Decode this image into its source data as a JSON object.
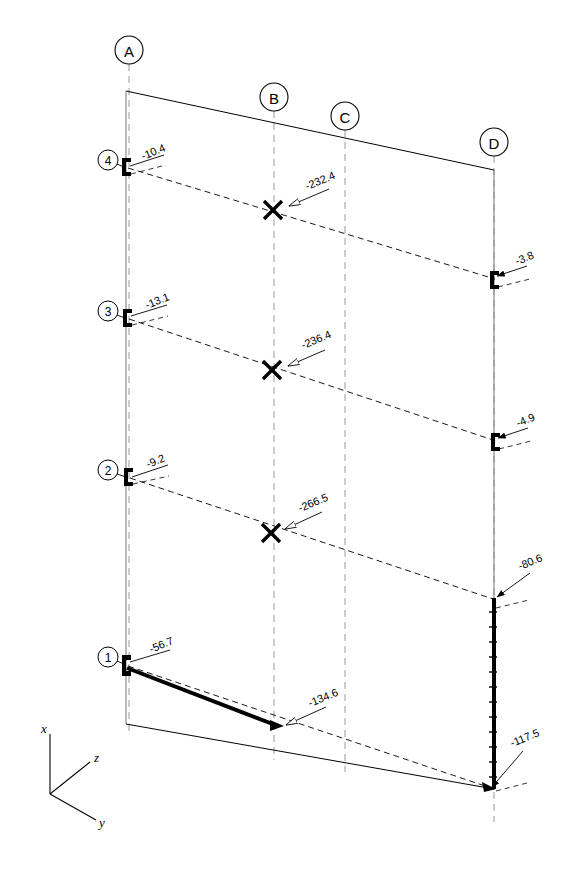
{
  "diagram": {
    "type": "structural-frame-elevation",
    "title": "",
    "background_color": "#ffffff",
    "line_color": "#000000",
    "grid_color": "#9a9a9a",
    "grid_lines": [
      {
        "id": "A",
        "label": "A",
        "bubble_cx": 129,
        "bubble_cy": 50,
        "x_top": 129,
        "x_bottom": 129,
        "line_top": 64,
        "line_bottom": 736
      },
      {
        "id": "B",
        "label": "B",
        "bubble_cx": 274,
        "bubble_cy": 97,
        "x_top": 274,
        "x_bottom": 274,
        "line_top": 111,
        "line_bottom": 760
      },
      {
        "id": "C",
        "label": "C",
        "bubble_cx": 345,
        "bubble_cy": 116,
        "x_top": 345,
        "x_bottom": 345,
        "line_top": 130,
        "line_bottom": 772
      },
      {
        "id": "D",
        "label": "D",
        "bubble_cx": 494,
        "bubble_cy": 142,
        "x_top": 494,
        "x_bottom": 494,
        "line_top": 156,
        "line_bottom": 822
      }
    ],
    "levels": [
      {
        "id": "4",
        "label": "4",
        "bubble_cx": 108,
        "bubble_cy": 160,
        "y_left": 164
      },
      {
        "id": "3",
        "label": "3",
        "bubble_cx": 108,
        "bubble_cy": 311,
        "y_left": 315
      },
      {
        "id": "2",
        "label": "2",
        "bubble_cx": 108,
        "bubble_cy": 470,
        "y_left": 474
      },
      {
        "id": "1",
        "label": "1",
        "bubble_cx": 108,
        "bubble_cy": 657,
        "y_left": 661
      }
    ],
    "value_labels": [
      {
        "id": "lvl4-left",
        "value": "-10.4",
        "text_x": 143,
        "text_y": 160,
        "rotate": -22,
        "leader_from": [
          130,
          166
        ],
        "leader_to": [
          164,
          155
        ],
        "anchor": "start"
      },
      {
        "id": "lvl3-left",
        "value": "-13.1",
        "text_x": 147,
        "text_y": 309,
        "rotate": -22,
        "leader_from": [
          131,
          316
        ],
        "leader_to": [
          167,
          305
        ],
        "anchor": "start"
      },
      {
        "id": "lvl2-left",
        "value": "-9.2",
        "text_x": 148,
        "text_y": 468,
        "rotate": -22,
        "leader_from": [
          132,
          477
        ],
        "leader_to": [
          168,
          465
        ],
        "anchor": "start"
      },
      {
        "id": "lvl1-left",
        "value": "-56.7",
        "text_x": 151,
        "text_y": 653,
        "rotate": -22,
        "leader_from": [
          130,
          662
        ],
        "leader_to": [
          170,
          650
        ],
        "anchor": "start"
      },
      {
        "id": "lvl4-mid",
        "value": "-232.4",
        "text_x": 307,
        "text_y": 190,
        "rotate": -22,
        "leader_from": [
          289,
          204
        ],
        "leader_to": [
          329,
          189
        ],
        "anchor": "start"
      },
      {
        "id": "lvl3-mid",
        "value": "-236.4",
        "text_x": 303,
        "text_y": 349,
        "rotate": -22,
        "leader_from": [
          288,
          363
        ],
        "leader_to": [
          325,
          350
        ],
        "anchor": "start"
      },
      {
        "id": "lvl2-mid",
        "value": "-266.5",
        "text_x": 300,
        "text_y": 512,
        "rotate": -22,
        "leader_from": [
          285,
          525
        ],
        "leader_to": [
          322,
          512
        ],
        "anchor": "start"
      },
      {
        "id": "lvl4-right",
        "value": "-3.8",
        "text_x": 517,
        "text_y": 265,
        "rotate": -22,
        "leader_from": [
          497,
          276
        ],
        "leader_to": [
          527,
          266
        ],
        "anchor": "start"
      },
      {
        "id": "lvl3-right",
        "value": "-4.9",
        "text_x": 518,
        "text_y": 427,
        "rotate": -22,
        "leader_from": [
          498,
          438
        ],
        "leader_to": [
          528,
          428
        ],
        "anchor": "start"
      },
      {
        "id": "base-right",
        "value": "-80.6",
        "text_x": 520,
        "text_y": 570,
        "rotate": -22,
        "leader_from": [
          496,
          597
        ],
        "leader_to": [
          530,
          573
        ],
        "anchor": "start"
      },
      {
        "id": "beam-b1",
        "value": "-134.6",
        "text_x": 310,
        "text_y": 707,
        "rotate": -22,
        "leader_from": [
          280,
          727
        ],
        "leader_to": [
          326,
          707
        ],
        "anchor": "start"
      },
      {
        "id": "base-col-d",
        "value": "-117.5",
        "text_x": 512,
        "text_y": 747,
        "rotate": -22,
        "leader_from": [
          485,
          789
        ],
        "leader_to": [
          523,
          751
        ],
        "anchor": "start"
      }
    ],
    "cross_markers": [
      {
        "id": "x-level-4",
        "cx": 273,
        "cy": 210,
        "size": 9
      },
      {
        "id": "x-level-3",
        "cx": 272,
        "cy": 370,
        "size": 9
      },
      {
        "id": "x-level-2",
        "cx": 271,
        "cy": 533,
        "size": 9
      }
    ],
    "frame_outline": {
      "top_edge": [
        [
          126,
          91
        ],
        [
          494,
          170
        ]
      ],
      "left_column": [
        [
          126,
          91
        ],
        [
          126,
          724
        ]
      ],
      "right_column": [
        [
          494,
          170
        ],
        [
          494,
          789
        ]
      ],
      "bottom_edge": [
        [
          126,
          724
        ],
        [
          494,
          789
        ]
      ]
    },
    "beams": [
      {
        "id": "beam-level-4",
        "from": [
          128,
          168
        ],
        "to": [
          495,
          279
        ],
        "style": "dashed"
      },
      {
        "id": "beam-level-3",
        "from": [
          129,
          319
        ],
        "to": [
          496,
          441
        ],
        "style": "dashed"
      },
      {
        "id": "beam-level-2",
        "from": [
          130,
          478
        ],
        "to": [
          496,
          600
        ],
        "style": "dashed"
      },
      {
        "id": "beam-level-1-deflected",
        "from": [
          128,
          666
        ],
        "to": [
          494,
          789
        ],
        "style": "dashed"
      }
    ],
    "heavy_members": [
      {
        "id": "heavy-beam-1-A-B",
        "from": [
          127,
          668
        ],
        "to": [
          278,
          726
        ],
        "width": 4
      },
      {
        "id": "heavy-column-D-base",
        "from": [
          494,
          598
        ],
        "to": [
          494,
          789
        ],
        "width": 4,
        "hatched": true
      }
    ],
    "supports": [
      {
        "id": "support-arrow-b-bottom",
        "x": 278,
        "y": 726,
        "kind": "arrow-triangle"
      },
      {
        "id": "support-arrow-d-base",
        "x": 494,
        "y": 789,
        "kind": "arrow-triangle"
      }
    ],
    "axis_triad": {
      "origin": [
        50,
        794
      ],
      "axes": [
        {
          "name": "x",
          "label": "x",
          "to": [
            50,
            734
          ],
          "label_x": 42,
          "label_y": 730
        },
        {
          "name": "z",
          "label": "z",
          "to": [
            90,
            762
          ],
          "label_x": 95,
          "label_y": 761
        },
        {
          "name": "y",
          "label": "y",
          "to": [
            96,
            820
          ],
          "label_x": 100,
          "label_y": 825
        }
      ]
    },
    "units_note": ""
  }
}
